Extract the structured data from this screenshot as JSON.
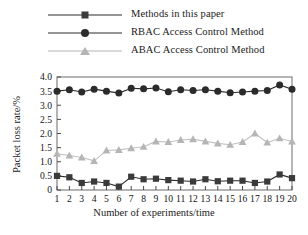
{
  "chart_data": {
    "type": "line",
    "title": "",
    "xlabel": "Number of experiments/time",
    "ylabel": "Packet loss rate/%",
    "x": [
      1,
      2,
      3,
      4,
      5,
      6,
      7,
      8,
      9,
      10,
      11,
      12,
      13,
      14,
      15,
      16,
      17,
      18,
      19,
      20
    ],
    "xlim": [
      1,
      20
    ],
    "ylim": [
      0,
      4.0
    ],
    "yticks": [
      "0",
      "0.5",
      "1.0",
      "1.5",
      "2.0",
      "2.5",
      "3.0",
      "3.5",
      "4.0"
    ],
    "ytick_values": [
      0,
      0.5,
      1.0,
      1.5,
      2.0,
      2.5,
      3.0,
      3.5,
      4.0
    ],
    "xticks": [
      "1",
      "2",
      "3",
      "4",
      "5",
      "6",
      "7",
      "8",
      "9",
      "10",
      "11",
      "12",
      "13",
      "14",
      "15",
      "16",
      "17",
      "18",
      "19",
      "20"
    ],
    "grid": false,
    "legend_position": "above-plot-left",
    "series": [
      {
        "name": "Methods in this paper",
        "marker": "square",
        "color": "#3a3a3a",
        "line_color": "#2b2b2b",
        "values": [
          0.5,
          0.45,
          0.25,
          0.3,
          0.25,
          0.12,
          0.47,
          0.38,
          0.4,
          0.35,
          0.33,
          0.3,
          0.38,
          0.31,
          0.33,
          0.33,
          0.25,
          0.3,
          0.55,
          0.42
        ]
      },
      {
        "name": "RBAC Access Control Method",
        "marker": "circle",
        "color": "#2b2b2b",
        "line_color": "#2b2b2b",
        "values": [
          3.5,
          3.55,
          3.47,
          3.57,
          3.5,
          3.43,
          3.6,
          3.58,
          3.61,
          3.48,
          3.55,
          3.52,
          3.55,
          3.5,
          3.44,
          3.47,
          3.5,
          3.52,
          3.72,
          3.57
        ]
      },
      {
        "name": "ABAC Access Control Method",
        "marker": "triangle",
        "color": "#b5b5b5",
        "line_color": "#c2c2c2",
        "values": [
          1.28,
          1.22,
          1.15,
          1.03,
          1.4,
          1.42,
          1.48,
          1.53,
          1.72,
          1.7,
          1.77,
          1.8,
          1.72,
          1.65,
          1.6,
          1.7,
          2.0,
          1.68,
          1.83,
          1.72
        ]
      }
    ]
  },
  "legend": {
    "items": [
      {
        "label": "Methods in this paper"
      },
      {
        "label": "RBAC Access Control Method"
      },
      {
        "label": "ABAC Access Control Method"
      }
    ]
  }
}
